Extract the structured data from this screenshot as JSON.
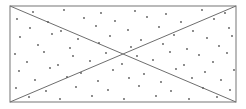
{
  "figure": {
    "canvas": {
      "width": 246,
      "height": 109,
      "background": "#ffffff"
    },
    "colors": {
      "rectangle_stroke": "#8c8c8c",
      "diagonal_stroke": "#6e6e6e",
      "point_fill": "#595959",
      "background": "#ffffff"
    },
    "strokes": {
      "rectangle_width": 1.2,
      "diagonal_width": 1.0,
      "point_radius": 0.9
    }
  },
  "chart_data": {
    "type": "scatter",
    "xlabel": "",
    "ylabel": "",
    "xlim": [
      10,
      236
    ],
    "ylim": [
      6,
      102
    ],
    "grid": false,
    "legend": null,
    "shapes": [
      {
        "name": "rectangle",
        "kind": "rect",
        "x": 10,
        "y": 6,
        "width": 226,
        "height": 96,
        "stroke": "#8c8c8c",
        "fill": "none"
      },
      {
        "name": "diagonal-top-left-to-bottom-right",
        "kind": "line",
        "x1": 10,
        "y1": 6,
        "x2": 236,
        "y2": 102,
        "stroke": "#6e6e6e"
      },
      {
        "name": "diagonal-bottom-left-to-top-right",
        "kind": "line",
        "x1": 10,
        "y1": 102,
        "x2": 236,
        "y2": 6,
        "stroke": "#6e6e6e"
      }
    ],
    "annotations": [
      {
        "name": "intersection-point",
        "x": 123,
        "y": 54
      }
    ],
    "points": [
      [
        33,
        12
      ],
      [
        64,
        10
      ],
      [
        101,
        13
      ],
      [
        135,
        11
      ],
      [
        166,
        14
      ],
      [
        202,
        10
      ],
      [
        225,
        13
      ],
      [
        17,
        19
      ],
      [
        48,
        22
      ],
      [
        84,
        18
      ],
      [
        115,
        21
      ],
      [
        147,
        17
      ],
      [
        181,
        22
      ],
      [
        214,
        19
      ],
      [
        30,
        28
      ],
      [
        61,
        31
      ],
      [
        96,
        26
      ],
      [
        128,
        30
      ],
      [
        159,
        27
      ],
      [
        193,
        31
      ],
      [
        229,
        28
      ],
      [
        20,
        37
      ],
      [
        52,
        34
      ],
      [
        78,
        39
      ],
      [
        110,
        36
      ],
      [
        141,
        40
      ],
      [
        174,
        35
      ],
      [
        207,
        38
      ],
      [
        232,
        36
      ],
      [
        38,
        45
      ],
      [
        70,
        48
      ],
      [
        99,
        43
      ],
      [
        131,
        47
      ],
      [
        163,
        44
      ],
      [
        187,
        49
      ],
      [
        219,
        46
      ],
      [
        15,
        54
      ],
      [
        44,
        52
      ],
      [
        73,
        56
      ],
      [
        106,
        53
      ],
      [
        137,
        56
      ],
      [
        170,
        52
      ],
      [
        199,
        55
      ],
      [
        227,
        53
      ],
      [
        27,
        62
      ],
      [
        58,
        65
      ],
      [
        90,
        61
      ],
      [
        122,
        64
      ],
      [
        153,
        60
      ],
      [
        184,
        65
      ],
      [
        213,
        62
      ],
      [
        19,
        71
      ],
      [
        50,
        68
      ],
      [
        81,
        73
      ],
      [
        113,
        70
      ],
      [
        144,
        74
      ],
      [
        176,
        69
      ],
      [
        205,
        72
      ],
      [
        234,
        70
      ],
      [
        35,
        80
      ],
      [
        67,
        77
      ],
      [
        98,
        81
      ],
      [
        129,
        78
      ],
      [
        161,
        82
      ],
      [
        192,
        78
      ],
      [
        221,
        80
      ],
      [
        16,
        88
      ],
      [
        46,
        91
      ],
      [
        76,
        87
      ],
      [
        108,
        90
      ],
      [
        139,
        86
      ],
      [
        171,
        91
      ],
      [
        203,
        88
      ],
      [
        230,
        90
      ],
      [
        29,
        97
      ],
      [
        60,
        99
      ],
      [
        92,
        96
      ],
      [
        124,
        99
      ],
      [
        156,
        96
      ],
      [
        189,
        99
      ],
      [
        217,
        97
      ]
    ]
  }
}
